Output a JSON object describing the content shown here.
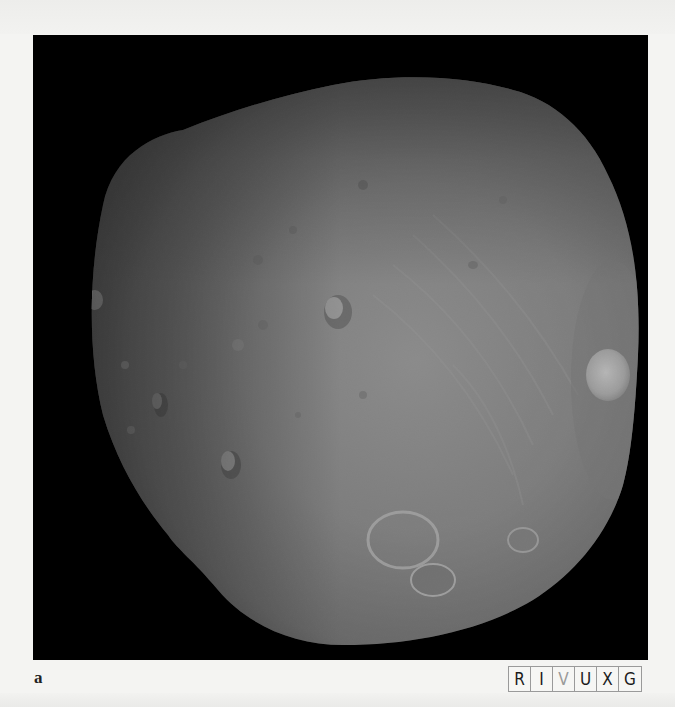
{
  "figure": {
    "panel_label": "a",
    "background_color": "#000000",
    "wavelength_strip": {
      "bands": [
        {
          "label": "R",
          "active": false
        },
        {
          "label": "I",
          "active": false
        },
        {
          "label": "V",
          "active": true
        },
        {
          "label": "U",
          "active": false
        },
        {
          "label": "X",
          "active": false
        },
        {
          "label": "G",
          "active": false
        }
      ],
      "active_color": "#9a9a9a",
      "inactive_color": "#1c1c1c"
    }
  }
}
